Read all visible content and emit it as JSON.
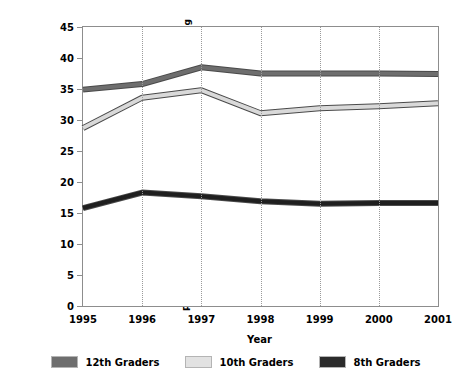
{
  "chart_data": {
    "type": "line",
    "title": "",
    "xlabel": "Year",
    "ylabel": "Percentage of Students Reporting Marijuana Use During the Previous 30 Days",
    "ylabel_line1": "Percentage of Students Reporting Marijuana Use During",
    "ylabel_line2": "the Previous 30 Days",
    "x": [
      1995,
      1996,
      1997,
      1998,
      1999,
      2000,
      2001
    ],
    "categories": [
      "1995",
      "1996",
      "1997",
      "1998",
      "1999",
      "2000",
      "2001"
    ],
    "xtick_labels": [
      "1995",
      "1996",
      "1997",
      "1998",
      "1999",
      "2000",
      "2001"
    ],
    "ytick_labels": [
      "45",
      "40",
      "35",
      "30",
      "25",
      "20",
      "15",
      "10",
      "5",
      "0"
    ],
    "yticks": [
      45,
      40,
      35,
      30,
      25,
      20,
      15,
      10,
      5,
      0
    ],
    "ylim": [
      0,
      45
    ],
    "xlim": [
      1995,
      2001
    ],
    "grid": "vertical-dotted",
    "legend_position": "bottom",
    "series": [
      {
        "name": "12th Graders",
        "color": "#6e6e6e",
        "values": [
          34.9,
          35.8,
          38.5,
          37.5,
          37.5,
          37.5,
          37.4
        ]
      },
      {
        "name": "10th Graders",
        "color": "#d9d9d9",
        "values": [
          28.7,
          33.6,
          34.8,
          31.1,
          31.9,
          32.2,
          32.7
        ]
      },
      {
        "name": "8th Graders",
        "color": "#1f1f1f",
        "values": [
          15.8,
          18.3,
          17.7,
          16.9,
          16.5,
          16.6,
          16.6
        ]
      }
    ]
  },
  "legend": {
    "items": [
      {
        "label": "12th Graders",
        "color": "#6e6e6e"
      },
      {
        "label": "10th Graders",
        "color": "#e2e2e2"
      },
      {
        "label": "8th Graders",
        "color": "#2b2b2b"
      }
    ]
  },
  "axis": {
    "frame_color": "#8d8d8d",
    "grid_color": "#9a9a9a"
  }
}
